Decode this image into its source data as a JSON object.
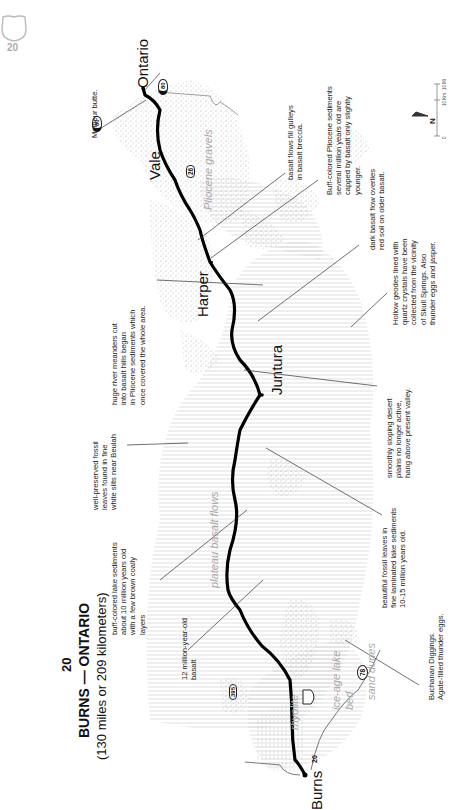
{
  "page": {
    "page_number": "20",
    "page_badge": "20"
  },
  "title": {
    "number": "20",
    "route": "BURNS — ONTARIO",
    "distance": "(130 miles or 209 kilometers)"
  },
  "towns": [
    {
      "name": "Burns"
    },
    {
      "name": "Juntura"
    },
    {
      "name": "Harper"
    },
    {
      "name": "Vale"
    },
    {
      "name": "Ontario"
    }
  ],
  "highway_shields": [
    {
      "label": "20",
      "type": "us-route"
    },
    {
      "label": "395",
      "type": "us-route"
    },
    {
      "label": "78",
      "type": "state-route"
    },
    {
      "label": "26",
      "type": "us-route"
    },
    {
      "label": "80",
      "type": "interstate"
    },
    {
      "label": "80",
      "type": "interstate"
    }
  ],
  "geologic_units": [
    {
      "label": "rhyolite"
    },
    {
      "label": "ice-age lake bed"
    },
    {
      "label": "sand dunes"
    },
    {
      "label": "plateau basalt flows"
    },
    {
      "label": "Pliocene gravels"
    }
  ],
  "annotations": {
    "basalt_12my": "12 million-year-old\nbasalt",
    "buff_lake": "buff-colored lake sediments\nabout 10 million years old\nwith a few brown coally\nlayers",
    "fossil_leaves_beulah": "well-preserved fossil\nleaves found in fine\nwhite silts near Beulah",
    "river_meanders": "huge river meanders cut\ninto basalt hills began\nin Pliocene sediments which\nonce covered the whole area.",
    "malheur_butte": "Malheur butte.",
    "buchanan": "Buchanan Diggings.\nAgate-filled thunder eggs.",
    "beautiful_fossils": "beautiful fossil leaves in\nfine laminated lake sediments\n10-15 million years old.",
    "desert_plains": "smoothly sloping desert\nplains no longer active,\nhang above present valley.",
    "geodes": "Hollow geodes lined with\nquartz crystals have been\ncollected from the vicinity\nof Skull Springs. Also\nthunder eggs and jasper.",
    "dark_basalt": "dark basalt flow overlies\nred soil on older basalt.",
    "buff_pliocene": "Buff-colored Pliocene sediments\nseveral million years old are\ncapped by basalt only slightly\nyounger.",
    "basalt_gulleys": "basalt flows fill gulleys\nin basalt breccia."
  },
  "legend": {
    "north": "N",
    "scale_0": "0",
    "scale_km": "10 Km",
    "scale_mi": "10 Mi"
  }
}
